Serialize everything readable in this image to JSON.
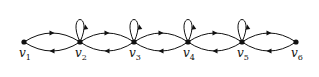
{
  "diagram": {
    "type": "directed-graph",
    "stroke_color": "#111111",
    "nodes": [
      {
        "id": "v1",
        "label": "v",
        "sub": "1",
        "x": 24,
        "y": 42,
        "loop": false
      },
      {
        "id": "v2",
        "label": "v",
        "sub": "2",
        "x": 80,
        "y": 42,
        "loop": true
      },
      {
        "id": "v3",
        "label": "v",
        "sub": "3",
        "x": 134,
        "y": 42,
        "loop": true
      },
      {
        "id": "v4",
        "label": "v",
        "sub": "4",
        "x": 188,
        "y": 42,
        "loop": true
      },
      {
        "id": "v5",
        "label": "v",
        "sub": "5",
        "x": 242,
        "y": 42,
        "loop": true
      },
      {
        "id": "v6",
        "label": "v",
        "sub": "6",
        "x": 296,
        "y": 42,
        "loop": false
      }
    ],
    "edges": [
      {
        "from": "v1",
        "to": "v2",
        "curve": "upper"
      },
      {
        "from": "v2",
        "to": "v1",
        "curve": "lower"
      },
      {
        "from": "v2",
        "to": "v3",
        "curve": "upper"
      },
      {
        "from": "v3",
        "to": "v2",
        "curve": "lower"
      },
      {
        "from": "v3",
        "to": "v4",
        "curve": "upper"
      },
      {
        "from": "v4",
        "to": "v3",
        "curve": "lower"
      },
      {
        "from": "v4",
        "to": "v5",
        "curve": "upper"
      },
      {
        "from": "v5",
        "to": "v4",
        "curve": "lower"
      },
      {
        "from": "v5",
        "to": "v6",
        "curve": "upper"
      },
      {
        "from": "v6",
        "to": "v5",
        "curve": "lower"
      },
      {
        "from": "v2",
        "to": "v2",
        "curve": "loop"
      },
      {
        "from": "v3",
        "to": "v3",
        "curve": "loop"
      },
      {
        "from": "v4",
        "to": "v4",
        "curve": "loop"
      },
      {
        "from": "v5",
        "to": "v5",
        "curve": "loop"
      }
    ]
  }
}
